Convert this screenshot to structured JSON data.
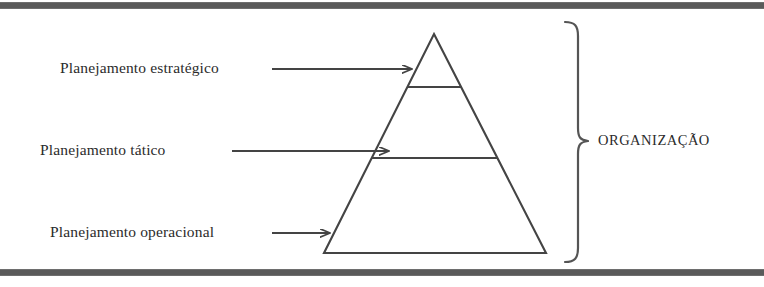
{
  "document": {
    "type": "hierarchy-pyramid-diagram",
    "language": "pt-BR"
  },
  "diagram": {
    "title": "",
    "shape": "pyramid",
    "levels": [
      {
        "id": "strategic",
        "label": "Planejamento estratégico",
        "position": "top",
        "arrow": "arrow-right"
      },
      {
        "id": "tactical",
        "label": "Planejamento tático",
        "position": "middle",
        "arrow": "arrow-right"
      },
      {
        "id": "operational",
        "label": "Planejamento operacional",
        "position": "bottom",
        "arrow": "arrow-right"
      }
    ],
    "grouping": {
      "bracket": "curly-brace-right",
      "label": "ORGANIZAÇÃO"
    },
    "colors": {
      "stroke": "#444444",
      "text": "#2b2b2b",
      "rule": "#5a5a5a",
      "background": "#ffffff"
    }
  },
  "rules": {
    "top": "horizontal-rule",
    "bottom": "horizontal-rule"
  }
}
